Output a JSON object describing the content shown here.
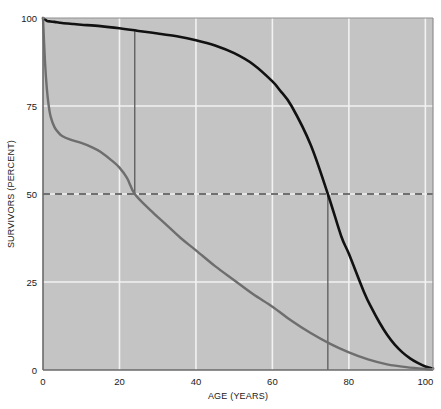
{
  "chart_data": {
    "type": "line",
    "title": "",
    "xlabel": "AGE (YEARS)",
    "ylabel": "SURVIVORS (PERCENT)",
    "xlim": [
      0,
      102
    ],
    "ylim": [
      0,
      100
    ],
    "xticks": [
      0,
      20,
      40,
      60,
      80,
      100
    ],
    "xtick_labels": [
      "0",
      "20",
      "40",
      "60",
      "80",
      "100"
    ],
    "yticks": [
      0,
      25,
      50,
      75,
      100
    ],
    "ytick_labels": [
      "0",
      "25",
      "50",
      "75",
      "100"
    ],
    "grid": true,
    "grid_color": "#f2f2f2",
    "plot_bgcolor": "#c4c4c4",
    "legend": "none",
    "series": [
      {
        "name": "modern-survivorship",
        "color": "#111111",
        "width": 2.6,
        "x": [
          0,
          1,
          2,
          3,
          5,
          8,
          10,
          15,
          20,
          24,
          25,
          30,
          35,
          40,
          45,
          50,
          55,
          60,
          62,
          65,
          70,
          74.5,
          78,
          80,
          84,
          86,
          88,
          90,
          92,
          94,
          96,
          98,
          100,
          102
        ],
        "y": [
          100,
          99.2,
          99.0,
          98.9,
          98.6,
          98.3,
          98.1,
          97.7,
          97.1,
          96.5,
          96.3,
          95.6,
          94.8,
          93.7,
          92.2,
          90.0,
          86.8,
          82.0,
          79.4,
          75.0,
          64.0,
          50.0,
          38.0,
          33.0,
          22.0,
          17.5,
          13.5,
          10.0,
          7.2,
          5.0,
          3.3,
          2.0,
          1.0,
          0.4
        ]
      },
      {
        "name": "historical-survivorship",
        "color": "#6e6e6e",
        "width": 2.4,
        "x": [
          0,
          0.5,
          1,
          1.5,
          2,
          3,
          4,
          5,
          7,
          10,
          13,
          15,
          18,
          20,
          22,
          24,
          28,
          32,
          36,
          40,
          45,
          50,
          55,
          60,
          65,
          70,
          75,
          80,
          85,
          90,
          95,
          100,
          102
        ],
        "y": [
          100,
          88,
          80,
          75,
          72,
          69,
          67.5,
          66.5,
          65.5,
          64.5,
          63.2,
          62.0,
          59.5,
          57.5,
          54.5,
          50.0,
          45.5,
          41.5,
          37.5,
          34.0,
          29.5,
          25.5,
          21.5,
          18.0,
          14.0,
          10.5,
          7.5,
          5.0,
          3.0,
          1.6,
          0.8,
          0.3,
          0.2
        ]
      }
    ],
    "reference_line": {
      "name": "median-survival-line",
      "orientation": "horizontal",
      "value": 50,
      "style": "dashed",
      "color": "#4a4a4a"
    },
    "markers": [
      {
        "name": "median-age-historical",
        "orientation": "vertical",
        "x": 24,
        "y_from": 96.5,
        "y_to": 50,
        "color": "#5a5a5a"
      },
      {
        "name": "median-age-modern",
        "orientation": "vertical",
        "x": 74.5,
        "y_from": 50,
        "y_to": 0,
        "color": "#5a5a5a"
      }
    ]
  }
}
